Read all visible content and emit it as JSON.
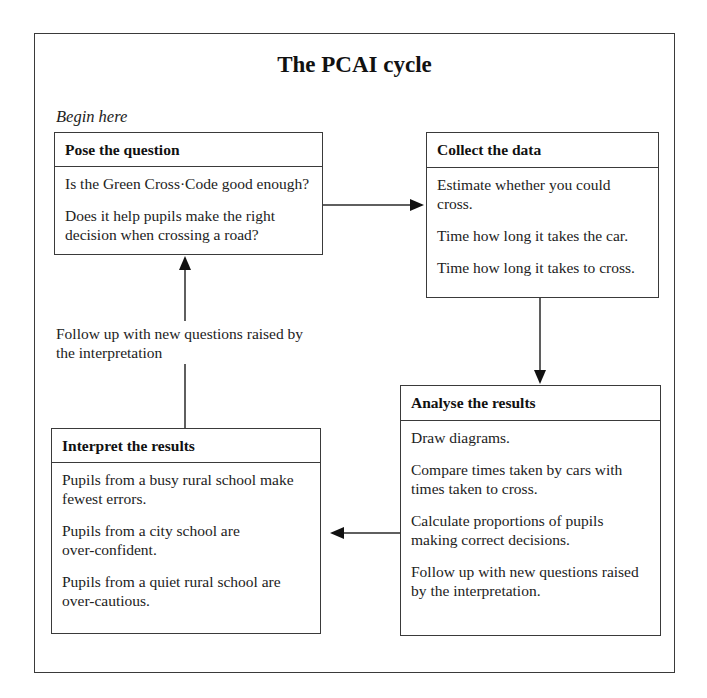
{
  "diagram": {
    "title": "The PCAI cycle",
    "start_label": "Begin here",
    "stages": [
      {
        "id": "pose",
        "heading": "Pose the question",
        "lines": [
          "Is the Green Cross·Code good enough?",
          "Does it help pupils make the right decision when crossing a road?"
        ]
      },
      {
        "id": "collect",
        "heading": "Collect the data",
        "lines": [
          "Estimate whether you could cross.",
          "Time how long it takes the car.",
          "Time how long it takes to cross."
        ]
      },
      {
        "id": "analyse",
        "heading": "Analyse the results",
        "lines": [
          "Draw diagrams.",
          "Compare times taken by cars with times taken to cross.",
          "Calculate proportions of pupils making correct decisions.",
          "Follow up with new questions raised by the interpretation."
        ]
      },
      {
        "id": "interpret",
        "heading": "Interpret the results",
        "lines": [
          "Pupils from a busy rural school make fewest errors.",
          "Pupils from a city school are over-confident.",
          "Pupils from a quiet rural school are over-cautious."
        ]
      }
    ],
    "loop_label": "Follow up with new questions raised by the interpretation",
    "flow": [
      {
        "from": "pose",
        "to": "collect"
      },
      {
        "from": "collect",
        "to": "analyse"
      },
      {
        "from": "analyse",
        "to": "interpret"
      },
      {
        "from": "interpret",
        "to": "pose",
        "label": "loop_label"
      }
    ]
  }
}
